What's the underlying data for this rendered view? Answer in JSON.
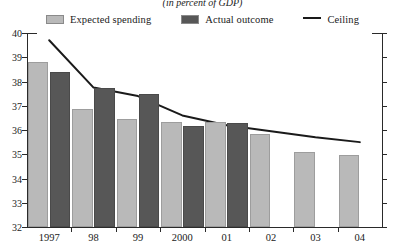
{
  "subtitle": "(in percent of GDP)",
  "legend": {
    "items": [
      {
        "label": "Expected spending",
        "marker": "swatch",
        "color": "#b9b9b9",
        "name": "legend-expected-spending"
      },
      {
        "label": "Actual outcome",
        "marker": "swatch",
        "color": "#575757",
        "name": "legend-actual-outcome"
      },
      {
        "label": "Ceiling",
        "marker": "line",
        "color": "#1a1a1a",
        "name": "legend-ceiling"
      }
    ]
  },
  "axis": {
    "y_ticks": [
      "40",
      "39",
      "38",
      "37",
      "36",
      "35",
      "34",
      "33",
      "32"
    ],
    "x_labels": [
      "1997",
      "98",
      "99",
      "2000",
      "01",
      "02",
      "03",
      "04"
    ]
  },
  "chart_data": {
    "type": "bar",
    "title": "",
    "subtitle": "(in percent of GDP)",
    "xlabel": "",
    "ylabel": "",
    "ylim": [
      32,
      40
    ],
    "ytick_step": 1,
    "grid": false,
    "legend_position": "top-center",
    "categories": [
      "1997",
      "98",
      "99",
      "2000",
      "01",
      "02",
      "03",
      "04"
    ],
    "series": [
      {
        "name": "Expected spending",
        "type": "bar",
        "color": "#b9b9b9",
        "values": [
          38.8,
          36.85,
          36.45,
          36.35,
          36.35,
          35.85,
          35.1,
          34.95
        ]
      },
      {
        "name": "Actual outcome",
        "type": "bar",
        "color": "#575757",
        "values": [
          38.4,
          37.75,
          37.5,
          36.15,
          36.3,
          null,
          null,
          null
        ]
      },
      {
        "name": "Ceiling",
        "type": "line",
        "color": "#1a1a1a",
        "values": [
          39.7,
          37.75,
          37.4,
          36.6,
          36.2,
          35.95,
          35.7,
          35.5
        ]
      }
    ]
  }
}
